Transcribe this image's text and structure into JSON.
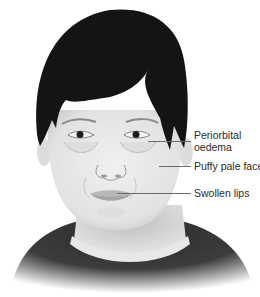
{
  "figure": {
    "labels": [
      {
        "id": "periorbital",
        "line1": "Periorbital",
        "line2": "oedema"
      },
      {
        "id": "puffy",
        "text": "Puffy pale face"
      },
      {
        "id": "lips",
        "text": "Swollen lips"
      }
    ]
  },
  "colors": {
    "hair": "#141414",
    "skin": "#e6e6e6",
    "shirt": "#3a3a3a",
    "text": "#2a2a2a",
    "leader": "#6a6a6a"
  }
}
